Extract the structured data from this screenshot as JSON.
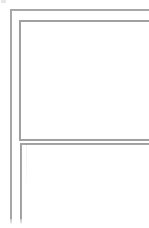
{
  "document": {
    "title": "",
    "background_color": "#ffffff"
  },
  "colors": {
    "page_background": "#ffffff",
    "outer_frame_line": "#8e8e8e",
    "panel_border_line": "#868686",
    "faint_rule": "#f2f2f2",
    "corner_mark": "#e3e3e3"
  },
  "canvas": {
    "width": 149,
    "height": 228,
    "description": "Cropped close-up of nested rectangular frame outlines on a white page. Lines continue past the right and bottom edges of the crop."
  },
  "outer_frame": {
    "label": "",
    "top_edge_y": 9,
    "left_edge_x": 10,
    "clipped_right": true,
    "clipped_bottom": true
  },
  "upper_panel": {
    "label": "",
    "top_edge_y": 20,
    "left_edge_x": 19,
    "bottom_edge_y": 139,
    "clipped_right": true,
    "content": ""
  },
  "lower_panel": {
    "label": "",
    "top_edge_y": 143,
    "left_edge_x": 20,
    "clipped_right": true,
    "clipped_bottom": true,
    "content": ""
  },
  "corner_mark": {
    "label": ""
  }
}
